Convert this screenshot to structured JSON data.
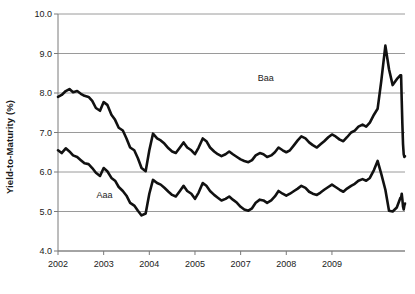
{
  "chart_data": {
    "type": "line",
    "title": "",
    "subtitle": "",
    "xlabel": "",
    "ylabel": "Yield-to-Maturity (%)",
    "ylim": [
      4.0,
      10.0
    ],
    "ytick_labels": [
      "10.0",
      "9.0",
      "8.0",
      "7.0",
      "6.0",
      "5.0",
      "4.0"
    ],
    "ytick_values": [
      10.0,
      9.0,
      8.0,
      7.0,
      6.0,
      5.0,
      4.0
    ],
    "xlim": [
      2002.0,
      2009.6
    ],
    "xtick_labels": [
      "2002",
      "2003",
      "2004",
      "2005",
      "2007",
      "2008",
      "2009"
    ],
    "xtick_values": [
      2002,
      2003,
      2004,
      2005,
      2006,
      2007,
      2008
    ],
    "grid": "horizontal",
    "legend_position": "inline-annotations",
    "line_color": "#111111",
    "grid_color": "#9a9a9a",
    "axis_color": "#7a7a7a",
    "series": [
      {
        "name": "Baa",
        "annotation_x": 2006.55,
        "annotation_y": 8.38,
        "x": [
          2002.0,
          2002.08,
          2002.17,
          2002.25,
          2002.33,
          2002.42,
          2002.5,
          2002.58,
          2002.67,
          2002.75,
          2002.83,
          2002.92,
          2003.0,
          2003.08,
          2003.17,
          2003.25,
          2003.33,
          2003.42,
          2003.5,
          2003.58,
          2003.67,
          2003.75,
          2003.83,
          2003.92,
          2004.0,
          2004.08,
          2004.17,
          2004.25,
          2004.33,
          2004.42,
          2004.5,
          2004.58,
          2004.67,
          2004.75,
          2004.83,
          2004.92,
          2005.0,
          2005.08,
          2005.17,
          2005.25,
          2005.33,
          2005.42,
          2005.5,
          2005.58,
          2005.67,
          2005.75,
          2005.83,
          2005.92,
          2006.0,
          2006.08,
          2006.17,
          2006.25,
          2006.33,
          2006.42,
          2006.5,
          2006.58,
          2006.67,
          2006.75,
          2006.83,
          2006.92,
          2007.0,
          2007.08,
          2007.17,
          2007.25,
          2007.33,
          2007.42,
          2007.5,
          2007.58,
          2007.67,
          2007.75,
          2007.83,
          2007.92,
          2008.0,
          2008.08,
          2008.17,
          2008.25,
          2008.33,
          2008.42,
          2008.5,
          2008.58,
          2008.67,
          2008.75,
          2008.83,
          2008.92,
          2009.0,
          2009.08,
          2009.17,
          2009.25,
          2009.33,
          2009.42,
          2009.5
        ],
        "y": [
          7.9,
          7.95,
          8.05,
          8.1,
          8.02,
          8.05,
          7.98,
          7.93,
          7.9,
          7.8,
          7.62,
          7.55,
          7.77,
          7.7,
          7.45,
          7.32,
          7.12,
          7.05,
          6.85,
          6.62,
          6.55,
          6.35,
          6.1,
          6.02,
          6.55,
          6.97,
          6.85,
          6.8,
          6.72,
          6.6,
          6.52,
          6.48,
          6.62,
          6.75,
          6.62,
          6.55,
          6.45,
          6.62,
          6.85,
          6.78,
          6.62,
          6.52,
          6.45,
          6.4,
          6.45,
          6.52,
          6.45,
          6.38,
          6.32,
          6.28,
          6.25,
          6.3,
          6.42,
          6.48,
          6.45,
          6.38,
          6.42,
          6.5,
          6.62,
          6.55,
          6.5,
          6.55,
          6.68,
          6.8,
          6.9,
          6.85,
          6.75,
          6.68,
          6.62,
          6.7,
          6.78,
          6.88,
          6.95,
          6.9,
          6.82,
          6.78,
          6.88,
          7.0,
          7.05,
          7.15,
          7.2,
          7.15,
          7.25,
          7.45,
          7.6,
          8.3,
          9.2,
          8.6,
          8.2,
          8.35,
          8.45
        ],
        "y_tail": [
          8.45,
          7.8,
          7.2,
          6.7,
          6.45,
          6.38,
          6.4
        ]
      },
      {
        "name": "Aaa",
        "annotation_x": 2003.02,
        "annotation_y": 5.42,
        "x": [
          2002.0,
          2002.08,
          2002.17,
          2002.25,
          2002.33,
          2002.42,
          2002.5,
          2002.58,
          2002.67,
          2002.75,
          2002.83,
          2002.92,
          2003.0,
          2003.08,
          2003.17,
          2003.25,
          2003.33,
          2003.42,
          2003.5,
          2003.58,
          2003.67,
          2003.75,
          2003.83,
          2003.92,
          2004.0,
          2004.08,
          2004.17,
          2004.25,
          2004.33,
          2004.42,
          2004.5,
          2004.58,
          2004.67,
          2004.75,
          2004.83,
          2004.92,
          2005.0,
          2005.08,
          2005.17,
          2005.25,
          2005.33,
          2005.42,
          2005.5,
          2005.58,
          2005.67,
          2005.75,
          2005.83,
          2005.92,
          2006.0,
          2006.08,
          2006.17,
          2006.25,
          2006.33,
          2006.42,
          2006.5,
          2006.58,
          2006.67,
          2006.75,
          2006.83,
          2006.92,
          2007.0,
          2007.08,
          2007.17,
          2007.25,
          2007.33,
          2007.42,
          2007.5,
          2007.58,
          2007.67,
          2007.75,
          2007.83,
          2007.92,
          2008.0,
          2008.08,
          2008.17,
          2008.25,
          2008.33,
          2008.42,
          2008.5,
          2008.58,
          2008.67,
          2008.75,
          2008.83,
          2008.92,
          2009.0,
          2009.08,
          2009.17,
          2009.25,
          2009.33,
          2009.42,
          2009.5
        ],
        "y": [
          6.55,
          6.48,
          6.6,
          6.52,
          6.42,
          6.38,
          6.3,
          6.22,
          6.2,
          6.1,
          5.98,
          5.9,
          6.1,
          6.02,
          5.85,
          5.78,
          5.62,
          5.52,
          5.4,
          5.22,
          5.15,
          5.02,
          4.9,
          4.95,
          5.45,
          5.8,
          5.72,
          5.68,
          5.6,
          5.5,
          5.42,
          5.38,
          5.52,
          5.65,
          5.52,
          5.45,
          5.32,
          5.48,
          5.72,
          5.65,
          5.52,
          5.42,
          5.35,
          5.28,
          5.32,
          5.38,
          5.3,
          5.22,
          5.12,
          5.05,
          5.02,
          5.08,
          5.22,
          5.3,
          5.28,
          5.22,
          5.28,
          5.38,
          5.52,
          5.45,
          5.4,
          5.45,
          5.52,
          5.58,
          5.65,
          5.6,
          5.5,
          5.45,
          5.42,
          5.48,
          5.55,
          5.62,
          5.68,
          5.62,
          5.55,
          5.5,
          5.58,
          5.65,
          5.7,
          5.78,
          5.82,
          5.78,
          5.85,
          6.05,
          6.28,
          5.95,
          5.55,
          5.02,
          5.0,
          5.1,
          5.35
        ],
        "y_tail": [
          5.35,
          5.45,
          5.3,
          5.12,
          5.05,
          5.15,
          5.2
        ]
      }
    ]
  }
}
